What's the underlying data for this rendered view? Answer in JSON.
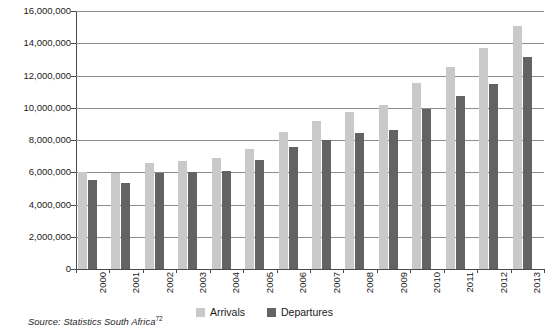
{
  "chart_data": {
    "type": "bar",
    "title": "",
    "subtitle": "",
    "xlabel": "",
    "ylabel": "",
    "ylim": [
      0,
      16000000
    ],
    "ytick_step": 2000000,
    "ytick_labels": [
      "16,000,000",
      "14,000,000",
      "12,000,000",
      "10,000,000",
      "8,000,000",
      "6,000,000",
      "4,000,000",
      "2,000,000",
      "0"
    ],
    "ytick_values": [
      16000000,
      14000000,
      12000000,
      10000000,
      8000000,
      6000000,
      4000000,
      2000000,
      0
    ],
    "grid": true,
    "grid_axis": "y",
    "legend_position": "bottom-center",
    "categories": [
      "2000",
      "2001",
      "2002",
      "2003",
      "2004",
      "2005",
      "2006",
      "2007",
      "2008",
      "2009",
      "2010",
      "2011",
      "2012",
      "2013"
    ],
    "series": [
      {
        "name": "Arrivals",
        "color": "#c9c9c9",
        "values": [
          6000000,
          5950000,
          6600000,
          6700000,
          6900000,
          7450000,
          8500000,
          9150000,
          9750000,
          10200000,
          11550000,
          12500000,
          13700000,
          15100000
        ]
      },
      {
        "name": "Departures",
        "color": "#636363",
        "values": [
          5500000,
          5350000,
          5950000,
          6000000,
          6100000,
          6750000,
          7550000,
          8000000,
          8450000,
          8650000,
          9900000,
          10700000,
          11450000,
          13150000
        ]
      }
    ]
  },
  "legend": {
    "items": [
      {
        "label": "Arrivals",
        "color": "#c9c9c9"
      },
      {
        "label": "Departures",
        "color": "#636363"
      }
    ]
  },
  "source": {
    "text": "Source: Statistics South Africa",
    "footnote": "72"
  }
}
